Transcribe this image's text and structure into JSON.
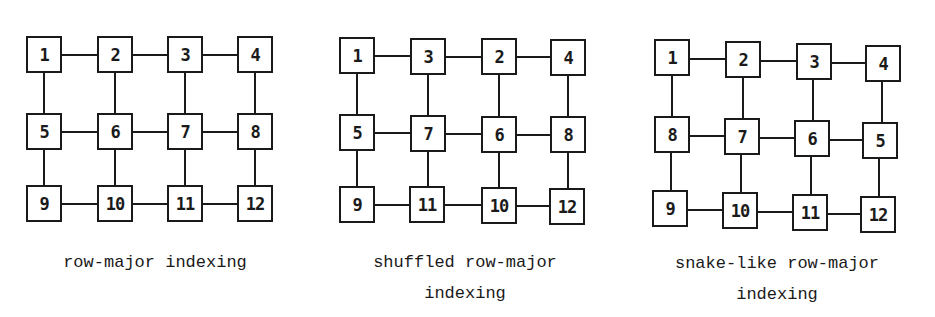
{
  "diagrams": [
    {
      "caption_line1": "row-major indexing",
      "caption_line2": "",
      "rows": [
        [
          "1",
          "2",
          "3",
          "4"
        ],
        [
          "5",
          "6",
          "7",
          "8"
        ],
        [
          "9",
          "10",
          "11",
          "12"
        ]
      ]
    },
    {
      "caption_line1": "shuffled row-major",
      "caption_line2": "indexing",
      "rows": [
        [
          "1",
          "3",
          "2",
          "4"
        ],
        [
          "5",
          "7",
          "6",
          "8"
        ],
        [
          "9",
          "11",
          "10",
          "12"
        ]
      ]
    },
    {
      "caption_line1": "snake-like row-major",
      "caption_line2": "indexing",
      "rows": [
        [
          "1",
          "2",
          "3",
          "4"
        ],
        [
          "8",
          "7",
          "6",
          "5"
        ],
        [
          "9",
          "10",
          "11",
          "12"
        ]
      ]
    }
  ]
}
